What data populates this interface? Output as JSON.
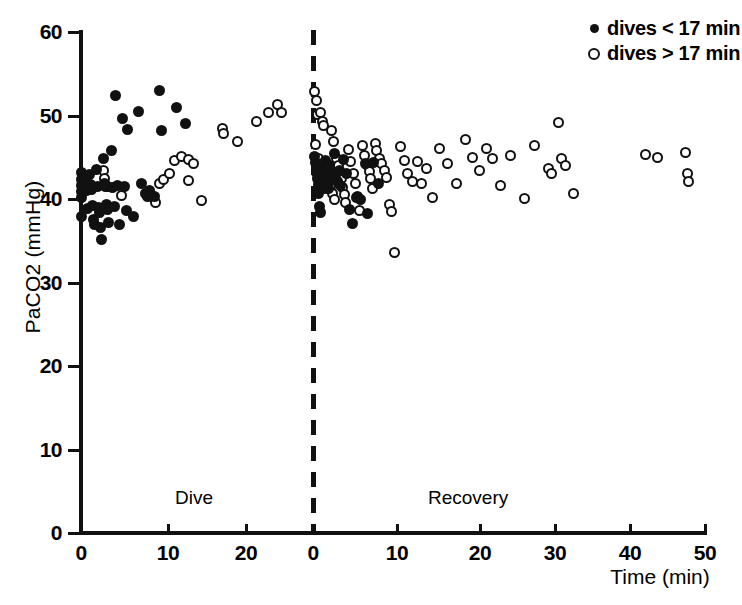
{
  "chart_data": {
    "type": "scatter",
    "title": "",
    "xlabel": "Time (min)",
    "ylabel": "PaCO2 (mmHg)",
    "ylim": [
      0,
      60
    ],
    "yticks": [
      0,
      10,
      20,
      30,
      40,
      50,
      60
    ],
    "ytick_labels": [
      "0",
      "10",
      "20",
      "30",
      "40",
      "50",
      "60"
    ],
    "grid": false,
    "panels": [
      {
        "name": "Dive",
        "label": "Dive",
        "xlim": [
          0,
          27
        ],
        "xticks": [
          0,
          10,
          20
        ],
        "xtick_labels": [
          "0",
          "10",
          "20"
        ]
      },
      {
        "name": "Recovery",
        "label": "Recovery",
        "xlim": [
          0,
          50
        ],
        "xticks": [
          0,
          10,
          20,
          30,
          40,
          50
        ],
        "xtick_labels": [
          "0",
          "10",
          "20",
          "30",
          "40",
          "50"
        ]
      }
    ],
    "divider": {
      "style": "dashed",
      "at": "panel-boundary"
    },
    "legend": {
      "position": "top-right",
      "entries": [
        {
          "marker": "filled-circle",
          "label": "dives < 17 min",
          "series": "short"
        },
        {
          "marker": "open-circle",
          "label": "dives > 17 min",
          "series": "long"
        }
      ]
    },
    "series": [
      {
        "name": "dives < 17 min",
        "marker": "filled-circle",
        "color": "#111111",
        "points": [
          {
            "panel": 0,
            "x": 0.0,
            "y": 43.2
          },
          {
            "panel": 0,
            "x": 0.0,
            "y": 42.3
          },
          {
            "panel": 0,
            "x": 0.0,
            "y": 41.6
          },
          {
            "panel": 0,
            "x": 0.0,
            "y": 40.9
          },
          {
            "panel": 0,
            "x": 0.0,
            "y": 40.2
          },
          {
            "panel": 0,
            "x": 0.0,
            "y": 37.9
          },
          {
            "panel": 0,
            "x": 0.5,
            "y": 42.4
          },
          {
            "panel": 0,
            "x": 0.6,
            "y": 41.0
          },
          {
            "panel": 0,
            "x": 0.7,
            "y": 38.9
          },
          {
            "panel": 0,
            "x": 1.0,
            "y": 42.9
          },
          {
            "panel": 0,
            "x": 1.1,
            "y": 41.7
          },
          {
            "panel": 0,
            "x": 1.2,
            "y": 41.1
          },
          {
            "panel": 0,
            "x": 1.3,
            "y": 39.2
          },
          {
            "panel": 0,
            "x": 1.4,
            "y": 37.6
          },
          {
            "panel": 0,
            "x": 1.5,
            "y": 36.9
          },
          {
            "panel": 0,
            "x": 1.8,
            "y": 43.5
          },
          {
            "panel": 0,
            "x": 1.9,
            "y": 41.5
          },
          {
            "panel": 0,
            "x": 2.0,
            "y": 39.0
          },
          {
            "panel": 0,
            "x": 2.1,
            "y": 38.4
          },
          {
            "panel": 0,
            "x": 2.2,
            "y": 36.6
          },
          {
            "panel": 0,
            "x": 2.4,
            "y": 35.2
          },
          {
            "panel": 0,
            "x": 2.6,
            "y": 44.9
          },
          {
            "panel": 0,
            "x": 2.7,
            "y": 41.9
          },
          {
            "panel": 0,
            "x": 2.8,
            "y": 41.5
          },
          {
            "panel": 0,
            "x": 2.9,
            "y": 39.3
          },
          {
            "panel": 0,
            "x": 3.0,
            "y": 38.7
          },
          {
            "panel": 0,
            "x": 3.2,
            "y": 37.2
          },
          {
            "panel": 0,
            "x": 3.5,
            "y": 45.8
          },
          {
            "panel": 0,
            "x": 3.6,
            "y": 41.4
          },
          {
            "panel": 0,
            "x": 3.8,
            "y": 39.1
          },
          {
            "panel": 0,
            "x": 4.0,
            "y": 52.4
          },
          {
            "panel": 0,
            "x": 4.2,
            "y": 41.6
          },
          {
            "panel": 0,
            "x": 4.4,
            "y": 36.9
          },
          {
            "panel": 0,
            "x": 4.8,
            "y": 49.6
          },
          {
            "panel": 0,
            "x": 5.0,
            "y": 41.5
          },
          {
            "panel": 0,
            "x": 5.2,
            "y": 38.6
          },
          {
            "panel": 0,
            "x": 5.4,
            "y": 48.3
          },
          {
            "panel": 0,
            "x": 6.0,
            "y": 37.9
          },
          {
            "panel": 0,
            "x": 6.6,
            "y": 50.5
          },
          {
            "panel": 0,
            "x": 7.0,
            "y": 41.8
          },
          {
            "panel": 0,
            "x": 7.4,
            "y": 40.6
          },
          {
            "panel": 0,
            "x": 7.6,
            "y": 40.3
          },
          {
            "panel": 0,
            "x": 7.9,
            "y": 41.0
          },
          {
            "panel": 0,
            "x": 8.1,
            "y": 40.4
          },
          {
            "panel": 0,
            "x": 8.4,
            "y": 40.3
          },
          {
            "panel": 0,
            "x": 9.0,
            "y": 53.0
          },
          {
            "panel": 0,
            "x": 9.3,
            "y": 48.2
          },
          {
            "panel": 0,
            "x": 11.0,
            "y": 51.0
          },
          {
            "panel": 0,
            "x": 12.0,
            "y": 49.1
          },
          {
            "panel": 1,
            "x": 0.2,
            "y": 45.1
          },
          {
            "panel": 1,
            "x": 0.3,
            "y": 44.4
          },
          {
            "panel": 1,
            "x": 0.4,
            "y": 43.2
          },
          {
            "panel": 1,
            "x": 0.5,
            "y": 42.4
          },
          {
            "panel": 1,
            "x": 0.6,
            "y": 41.7
          },
          {
            "panel": 1,
            "x": 0.7,
            "y": 40.6
          },
          {
            "panel": 1,
            "x": 0.8,
            "y": 39.1
          },
          {
            "panel": 1,
            "x": 0.9,
            "y": 38.4
          },
          {
            "panel": 1,
            "x": 1.0,
            "y": 43.6
          },
          {
            "panel": 1,
            "x": 1.1,
            "y": 42.8
          },
          {
            "panel": 1,
            "x": 1.2,
            "y": 42.2
          },
          {
            "panel": 1,
            "x": 1.3,
            "y": 41.8
          },
          {
            "panel": 1,
            "x": 1.4,
            "y": 41.3
          },
          {
            "panel": 1,
            "x": 1.5,
            "y": 44.6
          },
          {
            "panel": 1,
            "x": 1.6,
            "y": 43.9
          },
          {
            "panel": 1,
            "x": 1.7,
            "y": 42.6
          },
          {
            "panel": 1,
            "x": 1.8,
            "y": 42.0
          },
          {
            "panel": 1,
            "x": 1.9,
            "y": 41.2
          },
          {
            "panel": 1,
            "x": 2.0,
            "y": 44.0
          },
          {
            "panel": 1,
            "x": 2.2,
            "y": 43.0
          },
          {
            "panel": 1,
            "x": 2.3,
            "y": 42.5
          },
          {
            "panel": 1,
            "x": 2.5,
            "y": 45.4
          },
          {
            "panel": 1,
            "x": 2.7,
            "y": 42.8
          },
          {
            "panel": 1,
            "x": 2.9,
            "y": 42.1
          },
          {
            "panel": 1,
            "x": 3.1,
            "y": 43.4
          },
          {
            "panel": 1,
            "x": 3.3,
            "y": 41.6
          },
          {
            "panel": 1,
            "x": 3.6,
            "y": 44.7
          },
          {
            "panel": 1,
            "x": 4.0,
            "y": 43.1
          },
          {
            "panel": 1,
            "x": 4.4,
            "y": 38.8
          },
          {
            "panel": 1,
            "x": 4.7,
            "y": 37.1
          },
          {
            "panel": 1,
            "x": 5.2,
            "y": 40.2
          },
          {
            "panel": 1,
            "x": 5.6,
            "y": 40.0
          },
          {
            "panel": 1,
            "x": 6.2,
            "y": 44.3
          },
          {
            "panel": 1,
            "x": 6.5,
            "y": 38.3
          },
          {
            "panel": 1,
            "x": 7.2,
            "y": 44.4
          },
          {
            "panel": 1,
            "x": 7.8,
            "y": 41.9
          }
        ]
      },
      {
        "name": "dives > 17 min",
        "marker": "open-circle",
        "color": "#111111",
        "points": [
          {
            "panel": 0,
            "x": 2.6,
            "y": 43.4
          },
          {
            "panel": 0,
            "x": 2.7,
            "y": 42.5
          },
          {
            "panel": 0,
            "x": 3.1,
            "y": 41.5
          },
          {
            "panel": 0,
            "x": 4.6,
            "y": 40.4
          },
          {
            "panel": 0,
            "x": 8.0,
            "y": 40.4
          },
          {
            "panel": 0,
            "x": 8.3,
            "y": 40.2
          },
          {
            "panel": 0,
            "x": 8.6,
            "y": 39.6
          },
          {
            "panel": 0,
            "x": 9.0,
            "y": 41.8
          },
          {
            "panel": 0,
            "x": 9.5,
            "y": 42.3
          },
          {
            "panel": 0,
            "x": 10.2,
            "y": 43.1
          },
          {
            "panel": 0,
            "x": 10.8,
            "y": 44.6
          },
          {
            "panel": 0,
            "x": 11.6,
            "y": 45.1
          },
          {
            "panel": 0,
            "x": 12.3,
            "y": 44.7
          },
          {
            "panel": 0,
            "x": 12.9,
            "y": 44.3
          },
          {
            "panel": 0,
            "x": 12.4,
            "y": 42.2
          },
          {
            "panel": 0,
            "x": 13.8,
            "y": 39.8
          },
          {
            "panel": 0,
            "x": 16.3,
            "y": 48.4
          },
          {
            "panel": 0,
            "x": 16.4,
            "y": 47.8
          },
          {
            "panel": 0,
            "x": 18.0,
            "y": 46.9
          },
          {
            "panel": 0,
            "x": 20.2,
            "y": 49.3
          },
          {
            "panel": 0,
            "x": 21.6,
            "y": 50.4
          },
          {
            "panel": 0,
            "x": 22.6,
            "y": 51.3
          },
          {
            "panel": 0,
            "x": 23.1,
            "y": 50.3
          },
          {
            "panel": 1,
            "x": 0.2,
            "y": 52.9
          },
          {
            "panel": 1,
            "x": 0.4,
            "y": 51.8
          },
          {
            "panel": 1,
            "x": 0.5,
            "y": 50.1
          },
          {
            "panel": 1,
            "x": 0.9,
            "y": 50.3
          },
          {
            "panel": 1,
            "x": 1.1,
            "y": 49.3
          },
          {
            "panel": 1,
            "x": 1.3,
            "y": 48.8
          },
          {
            "panel": 1,
            "x": 0.3,
            "y": 46.5
          },
          {
            "panel": 1,
            "x": 2.2,
            "y": 48.2
          },
          {
            "panel": 1,
            "x": 2.4,
            "y": 46.9
          },
          {
            "panel": 1,
            "x": 0.6,
            "y": 44.9
          },
          {
            "panel": 1,
            "x": 0.8,
            "y": 44.1
          },
          {
            "panel": 1,
            "x": 1.0,
            "y": 43.3
          },
          {
            "panel": 1,
            "x": 1.2,
            "y": 42.6
          },
          {
            "panel": 1,
            "x": 1.4,
            "y": 42.0
          },
          {
            "panel": 1,
            "x": 1.6,
            "y": 43.8
          },
          {
            "panel": 1,
            "x": 1.8,
            "y": 43.1
          },
          {
            "panel": 1,
            "x": 2.0,
            "y": 42.4
          },
          {
            "panel": 1,
            "x": 2.1,
            "y": 41.5
          },
          {
            "panel": 1,
            "x": 2.3,
            "y": 40.6
          },
          {
            "panel": 1,
            "x": 2.5,
            "y": 39.9
          },
          {
            "panel": 1,
            "x": 2.8,
            "y": 44.8
          },
          {
            "panel": 1,
            "x": 3.0,
            "y": 44.0
          },
          {
            "panel": 1,
            "x": 3.2,
            "y": 43.2
          },
          {
            "panel": 1,
            "x": 3.4,
            "y": 42.4
          },
          {
            "panel": 1,
            "x": 3.5,
            "y": 41.4
          },
          {
            "panel": 1,
            "x": 3.7,
            "y": 40.5
          },
          {
            "panel": 1,
            "x": 3.9,
            "y": 39.6
          },
          {
            "panel": 1,
            "x": 4.2,
            "y": 45.9
          },
          {
            "panel": 1,
            "x": 4.5,
            "y": 44.5
          },
          {
            "panel": 1,
            "x": 4.8,
            "y": 43.0
          },
          {
            "panel": 1,
            "x": 5.0,
            "y": 41.8
          },
          {
            "panel": 1,
            "x": 5.3,
            "y": 40.3
          },
          {
            "panel": 1,
            "x": 5.5,
            "y": 38.6
          },
          {
            "panel": 1,
            "x": 5.9,
            "y": 46.4
          },
          {
            "panel": 1,
            "x": 6.1,
            "y": 45.2
          },
          {
            "panel": 1,
            "x": 6.4,
            "y": 44.1
          },
          {
            "panel": 1,
            "x": 6.7,
            "y": 43.3
          },
          {
            "panel": 1,
            "x": 6.9,
            "y": 42.4
          },
          {
            "panel": 1,
            "x": 7.1,
            "y": 41.3
          },
          {
            "panel": 1,
            "x": 7.4,
            "y": 46.6
          },
          {
            "panel": 1,
            "x": 7.6,
            "y": 45.8
          },
          {
            "panel": 1,
            "x": 7.9,
            "y": 44.9
          },
          {
            "panel": 1,
            "x": 8.2,
            "y": 44.2
          },
          {
            "panel": 1,
            "x": 8.5,
            "y": 43.4
          },
          {
            "panel": 1,
            "x": 8.8,
            "y": 42.6
          },
          {
            "panel": 1,
            "x": 9.1,
            "y": 39.3
          },
          {
            "panel": 1,
            "x": 9.4,
            "y": 38.5
          },
          {
            "panel": 1,
            "x": 9.7,
            "y": 33.6
          },
          {
            "panel": 1,
            "x": 10.4,
            "y": 46.3
          },
          {
            "panel": 1,
            "x": 10.9,
            "y": 44.6
          },
          {
            "panel": 1,
            "x": 11.3,
            "y": 43.0
          },
          {
            "panel": 1,
            "x": 11.8,
            "y": 42.1
          },
          {
            "panel": 1,
            "x": 12.4,
            "y": 44.5
          },
          {
            "panel": 1,
            "x": 12.9,
            "y": 41.8
          },
          {
            "panel": 1,
            "x": 13.5,
            "y": 43.6
          },
          {
            "panel": 1,
            "x": 14.2,
            "y": 40.2
          },
          {
            "panel": 1,
            "x": 15.1,
            "y": 46.0
          },
          {
            "panel": 1,
            "x": 16.0,
            "y": 44.3
          },
          {
            "panel": 1,
            "x": 17.1,
            "y": 41.9
          },
          {
            "panel": 1,
            "x": 18.2,
            "y": 47.1
          },
          {
            "panel": 1,
            "x": 19.0,
            "y": 45.0
          },
          {
            "panel": 1,
            "x": 19.8,
            "y": 43.4
          },
          {
            "panel": 1,
            "x": 20.6,
            "y": 46.1
          },
          {
            "panel": 1,
            "x": 21.4,
            "y": 44.9
          },
          {
            "panel": 1,
            "x": 22.3,
            "y": 41.6
          },
          {
            "panel": 1,
            "x": 23.5,
            "y": 45.2
          },
          {
            "panel": 1,
            "x": 25.2,
            "y": 40.1
          },
          {
            "panel": 1,
            "x": 26.4,
            "y": 46.4
          },
          {
            "panel": 1,
            "x": 28.0,
            "y": 43.6
          },
          {
            "panel": 1,
            "x": 28.4,
            "y": 43.0
          },
          {
            "panel": 1,
            "x": 29.2,
            "y": 49.2
          },
          {
            "panel": 1,
            "x": 29.6,
            "y": 44.8
          },
          {
            "panel": 1,
            "x": 30.1,
            "y": 44.0
          },
          {
            "panel": 1,
            "x": 31.0,
            "y": 40.6
          },
          {
            "panel": 1,
            "x": 39.6,
            "y": 45.3
          },
          {
            "panel": 1,
            "x": 41.0,
            "y": 45.0
          },
          {
            "panel": 1,
            "x": 44.4,
            "y": 45.6
          },
          {
            "panel": 1,
            "x": 44.6,
            "y": 43.0
          },
          {
            "panel": 1,
            "x": 44.7,
            "y": 42.1
          }
        ]
      }
    ]
  },
  "axis_geometry": {
    "note": "pixel anchors used by the template renderer",
    "y0_px": 533,
    "y60_px": 32,
    "p0_x0_px": 81,
    "p0_x10_px": 168,
    "p0_x20_px": 246,
    "p1_x0_px": 313,
    "p1_x10_px": 397,
    "p1_x20_px": 480,
    "p1_x30_px": 555,
    "p1_x40_px": 630,
    "p1_x50_px": 705
  }
}
